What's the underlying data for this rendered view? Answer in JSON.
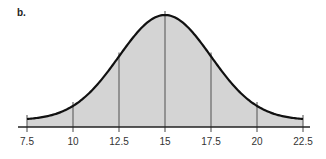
{
  "panel": {
    "label": "b."
  },
  "chart_data": {
    "type": "area",
    "title": "",
    "xlabel": "",
    "ylabel": "",
    "distribution": "normal",
    "mean": 15,
    "std_dev": 2.5,
    "x_ticks": [
      "7.5",
      "10",
      "12.5",
      "15",
      "17.5",
      "20",
      "22.5"
    ],
    "x_tick_values": [
      7.5,
      10,
      12.5,
      15,
      17.5,
      20,
      22.5
    ],
    "xlim": [
      7.5,
      22.5
    ],
    "vertical_lines_at": [
      7.5,
      10,
      12.5,
      15,
      17.5,
      20,
      22.5
    ],
    "grid": false,
    "fill_color": "#d4d4d4",
    "curve_color": "#111111"
  }
}
